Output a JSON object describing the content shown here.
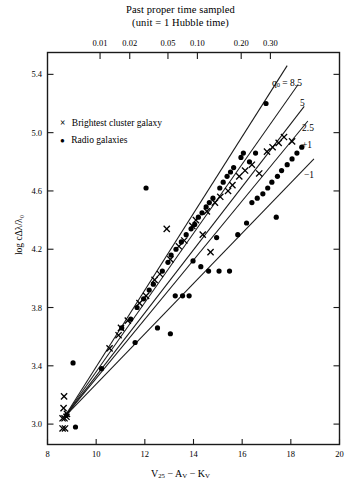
{
  "chart_data": {
    "type": "scatter",
    "title": "Past proper time sampled",
    "subtitle": "(unit = 1 Hubble time)",
    "xlabel": "V25 − AV − KV",
    "ylabel": "log cΔλ/λ0",
    "xlim": [
      8,
      20
    ],
    "ylim": [
      2.86,
      5.55
    ],
    "grid": false,
    "legend_position": "upper-left-inside",
    "x_ticks": [
      8,
      10,
      12,
      14,
      16,
      18,
      20
    ],
    "x_tick_labels": [
      "8",
      "10",
      "12",
      "14",
      "16",
      "18",
      "20"
    ],
    "y_ticks": [
      3.0,
      3.4,
      3.8,
      4.2,
      4.6,
      5.0,
      5.4
    ],
    "y_tick_labels": [
      "3.0",
      "3.4",
      "3.8",
      "4.2",
      "4.6",
      "5.0",
      "5.4"
    ],
    "top_axis_label": "Past proper time sampled (unit = 1 Hubble time)",
    "top_ticks_x": [
      10.16,
      11.38,
      12.95,
      14.16,
      15.96,
      17.16
    ],
    "top_tick_labels": [
      "0.01",
      "0.02",
      "0.05",
      "0.10",
      "0.20",
      "0.30"
    ],
    "series": [
      {
        "name": "Brightest cluster galaxy",
        "marker": "x",
        "color": "#000000",
        "points": [
          [
            8.62,
            3.04
          ],
          [
            8.7,
            3.04
          ],
          [
            8.78,
            3.05
          ],
          [
            8.62,
            2.97
          ],
          [
            8.72,
            2.97
          ],
          [
            8.66,
            3.11
          ],
          [
            8.68,
            3.19
          ],
          [
            8.8,
            3.07
          ],
          [
            10.55,
            3.52
          ],
          [
            10.92,
            3.61
          ],
          [
            11.02,
            3.66
          ],
          [
            11.3,
            3.71
          ],
          [
            11.78,
            3.83
          ],
          [
            12.05,
            3.88
          ],
          [
            12.4,
            3.99
          ],
          [
            12.62,
            4.03
          ],
          [
            13.05,
            4.13
          ],
          [
            13.4,
            4.22
          ],
          [
            13.62,
            4.26
          ],
          [
            13.95,
            4.36
          ],
          [
            14.1,
            4.4
          ],
          [
            14.38,
            4.3
          ],
          [
            14.55,
            4.46
          ],
          [
            14.88,
            4.52
          ],
          [
            15.1,
            4.56
          ],
          [
            15.42,
            4.6
          ],
          [
            15.6,
            4.64
          ],
          [
            15.88,
            4.7
          ],
          [
            16.12,
            4.74
          ],
          [
            16.4,
            4.78
          ],
          [
            16.7,
            4.72
          ],
          [
            17.02,
            4.87
          ],
          [
            17.25,
            4.9
          ],
          [
            17.5,
            4.93
          ],
          [
            17.72,
            4.97
          ],
          [
            18.05,
            4.94
          ],
          [
            12.9,
            4.34
          ],
          [
            14.7,
            4.18
          ]
        ]
      },
      {
        "name": "Radio galaxies",
        "marker": "o",
        "color": "#000000",
        "points": [
          [
            8.78,
            3.06
          ],
          [
            9.15,
            2.98
          ],
          [
            10.22,
            3.38
          ],
          [
            9.05,
            3.42
          ],
          [
            11.05,
            3.66
          ],
          [
            11.42,
            3.72
          ],
          [
            11.68,
            3.8
          ],
          [
            11.95,
            3.86
          ],
          [
            12.18,
            3.92
          ],
          [
            12.35,
            3.96
          ],
          [
            12.52,
            3.66
          ],
          [
            12.72,
            4.05
          ],
          [
            12.95,
            4.11
          ],
          [
            13.08,
            4.16
          ],
          [
            13.25,
            3.88
          ],
          [
            13.55,
            3.88
          ],
          [
            13.82,
            3.88
          ],
          [
            13.28,
            4.2
          ],
          [
            13.5,
            4.25
          ],
          [
            13.7,
            4.3
          ],
          [
            13.9,
            4.34
          ],
          [
            14.05,
            4.37
          ],
          [
            14.2,
            4.42
          ],
          [
            14.35,
            4.45
          ],
          [
            14.52,
            4.49
          ],
          [
            14.65,
            4.52
          ],
          [
            14.8,
            4.55
          ],
          [
            14.95,
            4.28
          ],
          [
            15.08,
            4.62
          ],
          [
            15.22,
            4.66
          ],
          [
            15.38,
            4.7
          ],
          [
            15.52,
            4.73
          ],
          [
            15.65,
            4.76
          ],
          [
            15.82,
            4.3
          ],
          [
            15.95,
            4.83
          ],
          [
            16.05,
            4.86
          ],
          [
            16.18,
            4.38
          ],
          [
            16.4,
            4.52
          ],
          [
            16.62,
            4.55
          ],
          [
            16.85,
            4.58
          ],
          [
            17.05,
            4.62
          ],
          [
            17.22,
            4.66
          ],
          [
            17.45,
            4.7
          ],
          [
            17.62,
            4.74
          ],
          [
            17.85,
            4.78
          ],
          [
            18.05,
            4.82
          ],
          [
            18.25,
            4.86
          ],
          [
            18.45,
            4.9
          ],
          [
            16.98,
            5.2
          ],
          [
            12.05,
            4.62
          ],
          [
            14.62,
            4.05
          ],
          [
            15.05,
            4.05
          ],
          [
            15.48,
            4.05
          ],
          [
            13.98,
            4.12
          ],
          [
            14.3,
            4.08
          ],
          [
            16.55,
            4.86
          ],
          [
            16.3,
            4.8
          ],
          [
            17.4,
            4.42
          ],
          [
            13.05,
            3.62
          ],
          [
            11.6,
            3.56
          ]
        ]
      }
    ],
    "model_lines": {
      "origin": [
        8.7,
        3.05
      ],
      "labels": [
        "q₀ = 8.5",
        "5",
        "2.5",
        "+1",
        "−1"
      ],
      "endpoints": [
        [
          17.85,
          5.46
        ],
        [
          18.3,
          5.33
        ],
        [
          18.55,
          5.18
        ],
        [
          18.7,
          5.08
        ],
        [
          18.95,
          4.82
        ]
      ]
    }
  },
  "legend": {
    "items": [
      {
        "marker": "×",
        "label": "Brightest cluster galaxy"
      },
      {
        "marker": "●",
        "label": "Radio galaxies"
      }
    ]
  },
  "axes": {
    "top_title_line1": "Past proper time sampled",
    "top_title_line2": "(unit = 1 Hubble time)",
    "x_axis_label_v": "V",
    "x_axis_label_25": "25",
    "x_axis_label_mid": " − A",
    "x_axis_label_v1": "V",
    "x_axis_label_mid2": " − K",
    "x_axis_label_v2": "V",
    "y_axis_label": "log cΔλ/λ₀"
  },
  "colors": {
    "axis": "#1a1a1a",
    "marker": "#000000",
    "background": "#ffffff"
  }
}
